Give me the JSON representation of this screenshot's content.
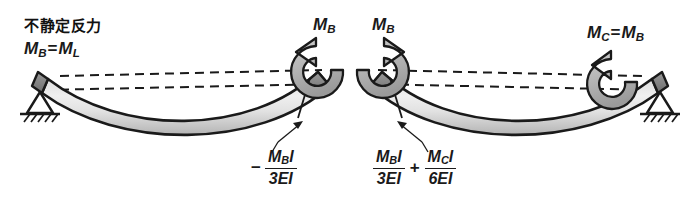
{
  "figure": {
    "title_note": "不静定反力",
    "reaction_relation": {
      "symbol": "M",
      "sub_left": "B",
      "equals": "=",
      "symbol_right": "M",
      "sub_right": "L"
    },
    "moment_labels": [
      {
        "name": "moment-label-mb-left",
        "symbol": "M",
        "subscript": "B"
      },
      {
        "name": "moment-label-mb-right",
        "symbol": "M",
        "subscript": "B"
      }
    ],
    "right_moment_label": {
      "symbol": "M",
      "subscript": "C",
      "equals": "=",
      "symbol2": "M",
      "subscript2": "B"
    },
    "rotation_left": {
      "sign": "−",
      "numerator": {
        "m": "M",
        "sub": "B",
        "l": "l"
      },
      "denominator": "3EI"
    },
    "rotation_right": {
      "term1": {
        "numerator": {
          "m": "M",
          "sub": "B",
          "l": "l"
        },
        "denominator": "3EI"
      },
      "operator": "+",
      "term2": {
        "numerator": {
          "m": "M",
          "sub": "C",
          "l": "l"
        },
        "denominator": "6EI"
      }
    },
    "supports": [
      {
        "name": "pin-support-left",
        "type": "pin-with-hatching"
      },
      {
        "name": "pin-support-right",
        "type": "pin-with-hatching"
      }
    ],
    "colors": {
      "stroke": "#1a1a1a",
      "beam_fill_light": "#f2f2f2",
      "beam_fill_dark": "#b8b8b8",
      "arrow_fill": "#b5b5b5",
      "background": "#ffffff"
    }
  }
}
